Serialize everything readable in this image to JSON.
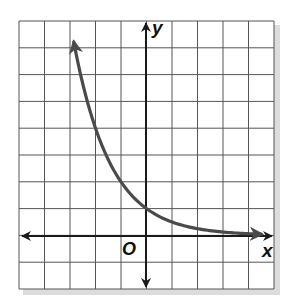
{
  "chart_data": {
    "type": "line",
    "title": "",
    "xlabel": "x",
    "ylabel": "y",
    "origin_label": "O",
    "xlim": [
      -5,
      5
    ],
    "ylim": [
      -2,
      8
    ],
    "grid": true,
    "grid_step": 1,
    "axes_arrows": true,
    "function": "y = 2^(-x)",
    "series": [
      {
        "name": "exponential decay curve",
        "x": [
          -2.85,
          -2,
          -1,
          0,
          1,
          2,
          3,
          4.5
        ],
        "y": [
          7.2,
          4,
          2,
          1,
          0.5,
          0.25,
          0.125,
          0.04
        ],
        "color": "#4a4a4a",
        "arrow_ends": true
      }
    ]
  },
  "labels": {
    "x_axis": "x",
    "y_axis": "y",
    "origin": "O"
  },
  "colors": {
    "grid": "#555555",
    "axes": "#1a1a1a",
    "curve": "#4a4a4a",
    "shadow": "#d8d8d8"
  }
}
